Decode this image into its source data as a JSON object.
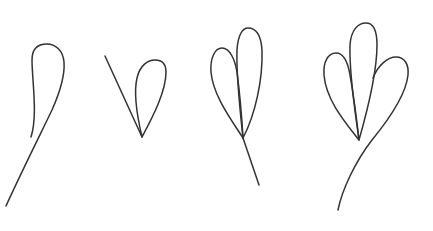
{
  "diagram": {
    "background_color": "#ffffff",
    "stroke_color": "#333333",
    "figures": [
      {
        "id": "figure-1",
        "petal_count": 1,
        "label": ""
      },
      {
        "id": "figure-2",
        "petal_count": 1,
        "label": ""
      },
      {
        "id": "figure-3",
        "petal_count": 2,
        "label": ""
      },
      {
        "id": "figure-4",
        "petal_count": 3,
        "label": ""
      }
    ]
  }
}
